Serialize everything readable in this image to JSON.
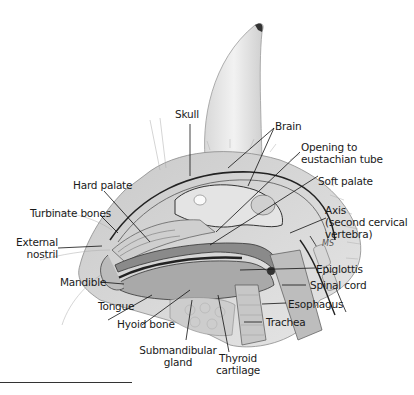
{
  "figure": {
    "labels": {
      "skull": "Skull",
      "brain": "Brain",
      "opening_eustachian_1": "Opening to",
      "opening_eustachian_2": "eustachian tube",
      "soft_palate": "Soft palate",
      "hard_palate": "Hard palate",
      "turbinate_bones": "Turbinate bones",
      "axis_1": "Axis",
      "axis_2": "(second cervical",
      "axis_3": "vertebra)",
      "external_nostril_1": "External",
      "external_nostril_2": "nostril",
      "mandible": "Mandible",
      "epiglottis": "Epiglottis",
      "spinal_cord": "Spinal cord",
      "tongue": "Tongue",
      "esophagus": "Esophagus",
      "hyoid_bone": "Hyoid bone",
      "trachea": "Trachea",
      "submandibular_gland_1": "Submandibular",
      "submandibular_gland_2": "gland",
      "thyroid_cartilage_1": "Thyroid",
      "thyroid_cartilage_2": "cartilage"
    },
    "signature": "MS"
  }
}
